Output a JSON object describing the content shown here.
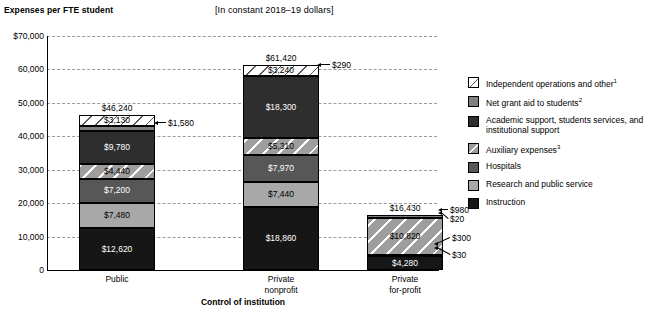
{
  "header": {
    "title": "Expenses per FTE student",
    "units_note": "[In constant 2018–19 dollars]"
  },
  "axes": {
    "x_title": "Control of institution",
    "y_ticks": [
      "$70,000",
      "60,000",
      "50,000",
      "40,000",
      "30,000",
      "20,000",
      "10,000",
      "0"
    ]
  },
  "legend": {
    "items": [
      {
        "label": "Independent operations and other",
        "sup": "1",
        "swatch": "hatch-white",
        "color": "#ffffff"
      },
      {
        "label": "Net grant aid to students",
        "sup": "2",
        "swatch": "solid",
        "color": "#808080"
      },
      {
        "label": "Academic support, students services, and institutional support",
        "sup": "",
        "swatch": "solid",
        "color": "#2e2e2e"
      },
      {
        "label": "Auxiliary expenses",
        "sup": "3",
        "swatch": "hatch-gray",
        "color": "#9e9e9e"
      },
      {
        "label": "Hospitals",
        "sup": "",
        "swatch": "solid",
        "color": "#575757"
      },
      {
        "label": "Research and public service",
        "sup": "",
        "swatch": "solid",
        "color": "#a8a8a8"
      },
      {
        "label": "Instruction",
        "sup": "",
        "swatch": "solid",
        "color": "#161616"
      }
    ]
  },
  "chart_data": {
    "type": "bar",
    "title": "Expenses per FTE student",
    "subtitle": "[In constant 2018–19 dollars]",
    "xlabel": "Control of institution",
    "ylabel": "",
    "ylim": [
      0,
      70000
    ],
    "ytick_step": 10000,
    "grid": true,
    "stacked": true,
    "legend_position": "right",
    "categories": [
      "Public",
      "Private nonprofit",
      "Private for-profit"
    ],
    "totals": [
      46240,
      61420,
      16430
    ],
    "total_labels": [
      "$46,240",
      "$61,420",
      "$16,430"
    ],
    "series": [
      {
        "name": "Instruction",
        "values": [
          12620,
          18860,
          4280
        ],
        "labels": [
          "$12,620",
          "$18,860",
          "$4,280"
        ]
      },
      {
        "name": "Research and public service",
        "values": [
          7480,
          7440,
          30
        ],
        "labels": [
          "$7,480",
          "$7,440",
          "$30"
        ]
      },
      {
        "name": "Hospitals",
        "values": [
          7200,
          7970,
          300
        ],
        "labels": [
          "$7,200",
          "$7,970",
          "$300"
        ]
      },
      {
        "name": "Auxiliary expenses",
        "values": [
          4440,
          5310,
          10820
        ],
        "labels": [
          "$4,440",
          "$5,310",
          "$10,820"
        ]
      },
      {
        "name": "Academic support, students services, and institutional support",
        "values": [
          9780,
          18300,
          20
        ],
        "labels": [
          "$9,780",
          "$18,300",
          "$20"
        ]
      },
      {
        "name": "Net grant aid to students",
        "values": [
          1580,
          290,
          980
        ],
        "labels": [
          "$1,580",
          "$290",
          "$980"
        ]
      },
      {
        "name": "Independent operations and other",
        "values": [
          3130,
          3240,
          0
        ],
        "labels": [
          "$3,130",
          "$3,240",
          ""
        ]
      }
    ]
  },
  "bars": {
    "public": {
      "category_line1": "Public",
      "category_line2": "",
      "total": "$46,240",
      "segments": [
        {
          "label": "$3,130",
          "style": "hatch-w",
          "text": "lt"
        },
        {
          "label": "$1,580",
          "style": "sw-grant",
          "text": "lt"
        },
        {
          "label": "$9,780",
          "style": "sw-acad",
          "text": "dk"
        },
        {
          "label": "$4,440",
          "style": "hatch-g",
          "text": "lt"
        },
        {
          "label": "$7,200",
          "style": "sw-hosp",
          "text": "dk"
        },
        {
          "label": "$7,480",
          "style": "sw-res",
          "text": "lt"
        },
        {
          "label": "$12,620",
          "style": "sw-instr",
          "text": "dk"
        }
      ],
      "callouts": [
        "$1,580"
      ]
    },
    "private_nonprofit": {
      "category_line1": "Private",
      "category_line2": "nonprofit",
      "total": "$61,420",
      "segments": [
        {
          "label": "$3,240",
          "style": "hatch-w",
          "text": "lt"
        },
        {
          "label": "$290",
          "style": "sw-grant",
          "text": "lt"
        },
        {
          "label": "$18,300",
          "style": "sw-acad",
          "text": "dk"
        },
        {
          "label": "$5,310",
          "style": "hatch-g",
          "text": "lt"
        },
        {
          "label": "$7,970",
          "style": "sw-hosp",
          "text": "dk"
        },
        {
          "label": "$7,440",
          "style": "sw-res",
          "text": "lt"
        },
        {
          "label": "$18,860",
          "style": "sw-instr",
          "text": "dk"
        }
      ],
      "callouts": [
        "$290"
      ]
    },
    "private_forprofit": {
      "category_line1": "Private",
      "category_line2": "for-profit",
      "total": "$16,430",
      "segments": [
        {
          "label": "$980",
          "style": "sw-grant",
          "text": "lt"
        },
        {
          "label": "$20",
          "style": "sw-acad",
          "text": "dk"
        },
        {
          "label": "$10,820",
          "style": "hatch-g",
          "text": "lt"
        },
        {
          "label": "$300",
          "style": "sw-hosp",
          "text": "dk"
        },
        {
          "label": "$30",
          "style": "sw-res",
          "text": "lt"
        },
        {
          "label": "$4,280",
          "style": "sw-instr",
          "text": "dk"
        }
      ],
      "callouts": [
        "$980",
        "$20",
        "$300",
        "$30"
      ]
    }
  }
}
